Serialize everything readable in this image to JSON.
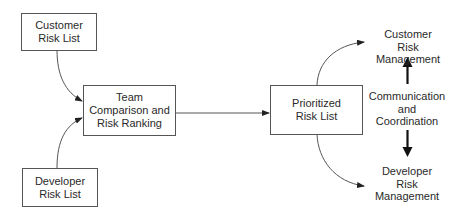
{
  "diagram": {
    "nodes": [
      {
        "id": "customer_risk_list",
        "label": "Customer\nRisk List"
      },
      {
        "id": "developer_risk_list",
        "label": "Developer\nRisk List"
      },
      {
        "id": "team_comparison",
        "label": "Team\nComparison and\nRisk Ranking"
      },
      {
        "id": "prioritized_risk_list",
        "label": "Prioritized\nRisk List"
      }
    ],
    "outcomes": [
      {
        "id": "customer_risk_management",
        "label": "Customer Risk\nManagement"
      },
      {
        "id": "developer_risk_management",
        "label": "Developer Risk\nManagement"
      }
    ],
    "link": {
      "id": "communication",
      "label": "Communication\nand\nCoordination"
    },
    "edges": [
      {
        "from": "customer_risk_list",
        "to": "team_comparison",
        "style": "curved-arrow"
      },
      {
        "from": "developer_risk_list",
        "to": "team_comparison",
        "style": "curved-arrow"
      },
      {
        "from": "team_comparison",
        "to": "prioritized_risk_list",
        "style": "straight-arrow"
      },
      {
        "from": "prioritized_risk_list",
        "to": "customer_risk_management",
        "style": "curved-arrow"
      },
      {
        "from": "prioritized_risk_list",
        "to": "developer_risk_management",
        "style": "curved-arrow"
      },
      {
        "from": "communication",
        "to": "customer_risk_management",
        "style": "thick-arrow"
      },
      {
        "from": "communication",
        "to": "developer_risk_management",
        "style": "thick-arrow"
      }
    ],
    "colors": {
      "line": "#555555",
      "thick_arrow": "#111111",
      "text": "#2a2a2a",
      "background": "#ffffff"
    }
  }
}
